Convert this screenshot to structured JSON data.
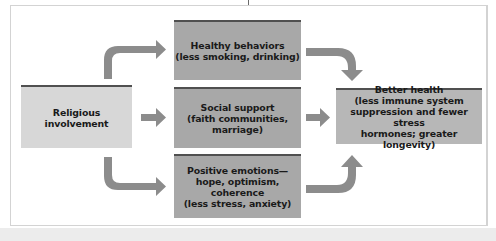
{
  "diagram": {
    "source": {
      "label": "Religious involvement"
    },
    "mediators": [
      {
        "label": "Healthy behaviors\n(less smoking, drinking)"
      },
      {
        "label": "Social support\n(faith communities,\nmarriage)"
      },
      {
        "label": "Positive emotions—\nhope, optimism,\ncoherence\n(less stress, anxiety)"
      }
    ],
    "outcome": {
      "label": "Better health\n(less immune system\nsuppression and fewer stress\nhormones; greater longevity)"
    },
    "edges": [
      {
        "from": "Religious involvement",
        "to": "Healthy behaviors"
      },
      {
        "from": "Religious involvement",
        "to": "Social support"
      },
      {
        "from": "Religious involvement",
        "to": "Positive emotions"
      },
      {
        "from": "Healthy behaviors",
        "to": "Better health"
      },
      {
        "from": "Social support",
        "to": "Better health"
      },
      {
        "from": "Positive emotions",
        "to": "Better health"
      }
    ],
    "colors": {
      "source_box": "#d7d7d7",
      "mediator_box": "#a8a8a8",
      "outcome_box": "#b7b7b7",
      "box_top_bar": "#505050",
      "arrow": "#8c8c8c",
      "text": "#1a1a1a"
    }
  }
}
